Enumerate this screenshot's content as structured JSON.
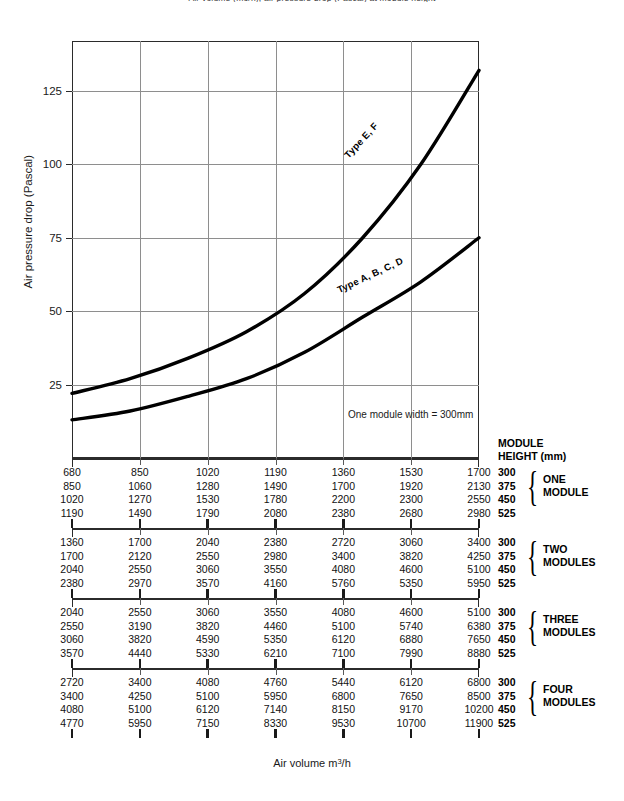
{
  "top_caption": "Air volume (m3/h), air pressure drop (Pascal) at module height",
  "chart_data": {
    "type": "line",
    "title": "",
    "xlabel": "Air volume m3/h",
    "ylabel": "Air pressure drop (Pascal)",
    "ylim": [
      0,
      142
    ],
    "yticks": [
      25,
      50,
      75,
      100,
      125
    ],
    "ytick_labels": [
      "25",
      "50",
      "75",
      "100",
      "125"
    ],
    "grid": true,
    "legend_position": "inline-curve-labels",
    "x_gridline_count": 6,
    "annotation": "One module width = 300mm",
    "series": [
      {
        "name": "Type E, F",
        "label": "Type E, F",
        "x": [
          0,
          1,
          2,
          3,
          4,
          5,
          6,
          7
        ],
        "values": [
          22,
          27,
          34,
          43,
          56,
          75,
          100,
          132
        ]
      },
      {
        "name": "Type A, B, C, D",
        "label": "Type A, B, C, D",
        "x": [
          0,
          1,
          2,
          3,
          4,
          5,
          6,
          7
        ],
        "values": [
          13,
          16,
          21,
          27,
          36,
          48,
          60,
          75
        ]
      }
    ]
  },
  "module_header": {
    "line1": "MODULE",
    "line2": "HEIGHT (mm)"
  },
  "axis_titles": {
    "y": "Air pressure drop (Pascal)",
    "x_prefix": "Air volume m",
    "x_sup": "3",
    "x_suffix": "/h"
  },
  "blocks": [
    {
      "group_line1": "ONE",
      "group_line2": "MODULE",
      "heights": [
        "300",
        "375",
        "450",
        "525"
      ],
      "rows": [
        [
          "680",
          "850",
          "1020",
          "1190",
          "1360",
          "1530",
          "1700"
        ],
        [
          "850",
          "1060",
          "1280",
          "1490",
          "1700",
          "1920",
          "2130"
        ],
        [
          "1020",
          "1270",
          "1530",
          "1780",
          "2200",
          "2300",
          "2550"
        ],
        [
          "1190",
          "1490",
          "1790",
          "2080",
          "2380",
          "2680",
          "2980"
        ]
      ]
    },
    {
      "group_line1": "TWO",
      "group_line2": "MODULES",
      "heights": [
        "300",
        "375",
        "450",
        "525"
      ],
      "rows": [
        [
          "1360",
          "1700",
          "2040",
          "2380",
          "2720",
          "3060",
          "3400"
        ],
        [
          "1700",
          "2120",
          "2550",
          "2980",
          "3400",
          "3820",
          "4250"
        ],
        [
          "2040",
          "2550",
          "3060",
          "3550",
          "4080",
          "4600",
          "5100"
        ],
        [
          "2380",
          "2970",
          "3570",
          "4160",
          "5760",
          "5350",
          "5950"
        ]
      ]
    },
    {
      "group_line1": "THREE",
      "group_line2": "MODULES",
      "heights": [
        "300",
        "375",
        "450",
        "525"
      ],
      "rows": [
        [
          "2040",
          "2550",
          "3060",
          "3550",
          "4080",
          "4600",
          "5100"
        ],
        [
          "2550",
          "3190",
          "3820",
          "4460",
          "5100",
          "5740",
          "6380"
        ],
        [
          "3060",
          "3820",
          "4590",
          "5350",
          "6120",
          "6880",
          "7650"
        ],
        [
          "3570",
          "4440",
          "5330",
          "6210",
          "7100",
          "7990",
          "8880"
        ]
      ]
    },
    {
      "group_line1": "FOUR",
      "group_line2": "MODULES",
      "heights": [
        "300",
        "375",
        "450",
        "525"
      ],
      "rows": [
        [
          "2720",
          "3400",
          "4080",
          "4760",
          "5440",
          "6120",
          "6800"
        ],
        [
          "3400",
          "4250",
          "5100",
          "5950",
          "6800",
          "7650",
          "8500"
        ],
        [
          "4080",
          "5100",
          "6120",
          "7140",
          "8150",
          "9170",
          "10200"
        ],
        [
          "4770",
          "5950",
          "7150",
          "8330",
          "9530",
          "10700",
          "11900"
        ]
      ]
    }
  ]
}
